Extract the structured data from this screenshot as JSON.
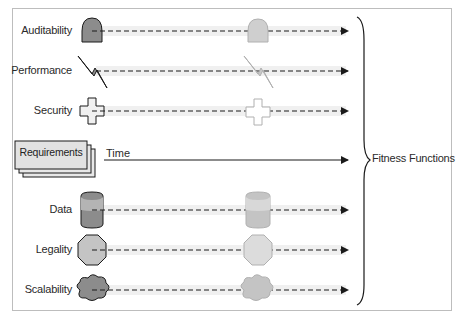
{
  "diagram": {
    "rows": [
      {
        "label": "Auditability",
        "shape": "dome-icon",
        "fill": "#8c8c8c"
      },
      {
        "label": "Performance",
        "shape": "lightning-icon",
        "fill": "#8c8c8c"
      },
      {
        "label": "Security",
        "shape": "cross-icon",
        "fill": "#f0f0f0"
      },
      {
        "label": "Data",
        "shape": "cylinder-icon",
        "fill": "#8c8c8c"
      },
      {
        "label": "Legality",
        "shape": "octagon-icon",
        "fill": "#c4c4c4"
      },
      {
        "label": "Scalability",
        "shape": "cloud-icon",
        "fill": "#8c8c8c"
      }
    ],
    "requirements_label": "Requirements",
    "time_label": "Time",
    "fitness_label": "Fitness Functions",
    "colors": {
      "line": "#1a1a1a",
      "band": "#efefef",
      "frame": "#bdbdbd",
      "faded": "#cfcfcf"
    }
  }
}
